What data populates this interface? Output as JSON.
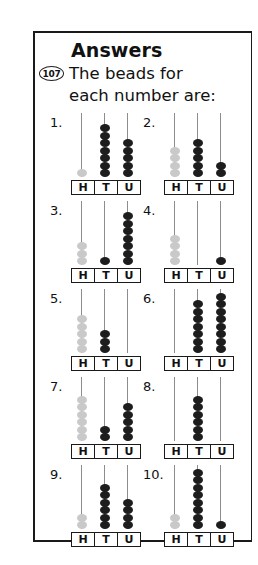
{
  "page": {
    "heading": "Answers",
    "badge": "107",
    "intro_line1": "The beads for",
    "intro_line2": "each number are:",
    "colors": {
      "bead_dark": "#1d1d1d",
      "bead_light": "#c9c9c9",
      "rod": "#8d8d8d",
      "ink": "#111111",
      "border": "#1a1a1a",
      "background": "#ffffff"
    }
  },
  "column_labels": [
    "H",
    "T",
    "U"
  ],
  "abacus_items": [
    {
      "number": "1.",
      "columns": [
        {
          "label": "H",
          "beads": 1,
          "shade": "light"
        },
        {
          "label": "T",
          "beads": 7,
          "shade": "dark"
        },
        {
          "label": "U",
          "beads": 5,
          "shade": "dark"
        }
      ]
    },
    {
      "number": "2.",
      "columns": [
        {
          "label": "H",
          "beads": 4,
          "shade": "light"
        },
        {
          "label": "T",
          "beads": 5,
          "shade": "dark"
        },
        {
          "label": "U",
          "beads": 2,
          "shade": "dark"
        }
      ]
    },
    {
      "number": "3.",
      "columns": [
        {
          "label": "H",
          "beads": 3,
          "shade": "light"
        },
        {
          "label": "T",
          "beads": 1,
          "shade": "dark"
        },
        {
          "label": "U",
          "beads": 7,
          "shade": "dark"
        }
      ]
    },
    {
      "number": "4.",
      "columns": [
        {
          "label": "H",
          "beads": 4,
          "shade": "light"
        },
        {
          "label": "T",
          "beads": 0,
          "shade": "dark"
        },
        {
          "label": "U",
          "beads": 1,
          "shade": "dark"
        }
      ]
    },
    {
      "number": "5.",
      "columns": [
        {
          "label": "H",
          "beads": 5,
          "shade": "light"
        },
        {
          "label": "T",
          "beads": 3,
          "shade": "dark"
        },
        {
          "label": "U",
          "beads": 0,
          "shade": "dark"
        }
      ]
    },
    {
      "number": "6.",
      "columns": [
        {
          "label": "H",
          "beads": 0,
          "shade": "light"
        },
        {
          "label": "T",
          "beads": 7,
          "shade": "dark"
        },
        {
          "label": "U",
          "beads": 8,
          "shade": "dark"
        }
      ]
    },
    {
      "number": "7.",
      "columns": [
        {
          "label": "H",
          "beads": 6,
          "shade": "light"
        },
        {
          "label": "T",
          "beads": 2,
          "shade": "dark"
        },
        {
          "label": "U",
          "beads": 5,
          "shade": "dark"
        }
      ]
    },
    {
      "number": "8.",
      "columns": [
        {
          "label": "H",
          "beads": 0,
          "shade": "light"
        },
        {
          "label": "T",
          "beads": 6,
          "shade": "dark"
        },
        {
          "label": "U",
          "beads": 0,
          "shade": "dark"
        }
      ]
    },
    {
      "number": "9.",
      "columns": [
        {
          "label": "H",
          "beads": 2,
          "shade": "light"
        },
        {
          "label": "T",
          "beads": 6,
          "shade": "dark"
        },
        {
          "label": "U",
          "beads": 4,
          "shade": "dark"
        }
      ]
    },
    {
      "number": "10.",
      "columns": [
        {
          "label": "H",
          "beads": 2,
          "shade": "light"
        },
        {
          "label": "T",
          "beads": 8,
          "shade": "dark"
        },
        {
          "label": "U",
          "beads": 1,
          "shade": "dark"
        }
      ]
    }
  ]
}
